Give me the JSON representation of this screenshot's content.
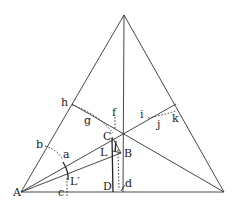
{
  "diagram": {
    "type": "geometric construction in equilateral triangle",
    "colors": {
      "background": "#ffffff",
      "ink": "#333333"
    },
    "points": {
      "A": [
        21,
        192
      ],
      "R": [
        224,
        192
      ],
      "T": [
        124,
        15
      ],
      "O": [
        123,
        133
      ],
      "h": [
        72,
        104
      ],
      "k": [
        176,
        104
      ],
      "b": [
        45,
        146
      ],
      "a": [
        62,
        158
      ],
      "c": [
        67,
        192
      ],
      "C": [
        112,
        137
      ],
      "B": [
        121,
        153
      ],
      "L": [
        113,
        151
      ],
      "D": [
        113,
        192
      ],
      "d": [
        120,
        192
      ]
    },
    "labels": {
      "A": "A",
      "b": "b",
      "a": "a",
      "c": "c",
      "Lp": "L′",
      "h": "h",
      "g": "g",
      "f": "f",
      "C": "C",
      "L": "L",
      "B": "B",
      "D": "D",
      "d": "d",
      "i": "i",
      "j": "j",
      "k": "k"
    }
  }
}
